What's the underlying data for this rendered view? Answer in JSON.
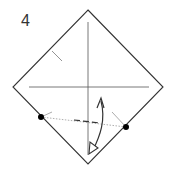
{
  "diagram": {
    "step_number": "4",
    "type": "origami fold instruction",
    "elements": [
      "square paper rotated 45 degrees",
      "vertical crease",
      "horizontal crease",
      "short crease mark upper-left",
      "two reference dots",
      "dotted fold line",
      "dashed valley fold line",
      "curved fold arrow"
    ],
    "colors": {
      "line": "#333333",
      "crease": "#555555",
      "dot": "#000000"
    }
  }
}
